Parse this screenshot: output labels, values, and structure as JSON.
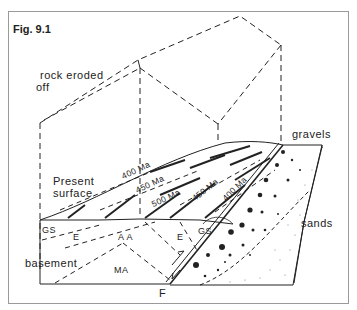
{
  "figure": {
    "title": "Fig. 9.1"
  },
  "labels": {
    "rock_eroded": "rock eroded",
    "off": "off",
    "gravels": "gravels",
    "present": "Present",
    "surface": "surface",
    "sands": "sands",
    "basement": "basement",
    "fault": "F",
    "gs_left": "GS",
    "gs_right": "GS",
    "e_left": "E",
    "e_right": "E",
    "aa": "A A",
    "ma": "MA"
  },
  "strata_ages": {
    "left_400": "400 Ma",
    "left_450": "450 Ma",
    "center_500": "500 Ma",
    "right_450": "450 Ma",
    "right_400": "400 Ma"
  },
  "colors": {
    "line": "#222222",
    "frame": "#9a9a9a",
    "background": "#ffffff"
  }
}
